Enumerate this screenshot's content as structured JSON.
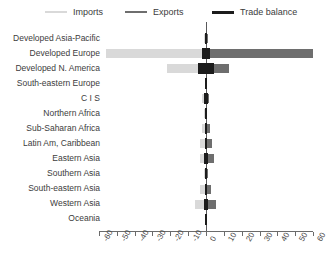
{
  "chart_data": {
    "type": "bar",
    "orientation": "horizontal",
    "title": "",
    "subtitle": "",
    "xlabel": "",
    "ylabel": "",
    "xlim": [
      -60,
      60
    ],
    "xticks": [
      -60,
      -50,
      -40,
      -30,
      -20,
      -10,
      0,
      10,
      20,
      30,
      40,
      50,
      60
    ],
    "xtick_labels": [
      "-60",
      "-50",
      "-40",
      "-30",
      "-20",
      "-10",
      "0",
      "10",
      "20",
      "30",
      "40",
      "50",
      "60"
    ],
    "grid": false,
    "legend_position": "top",
    "zero_line": 0,
    "categories": [
      "Developed Asia-Pacific",
      "Developed Europe",
      "Developed N. America",
      "South-eastern Europe",
      "C I S",
      "Northern Africa",
      "Sub-Saharan Africa",
      "Latin Am, Caribbean",
      "Eastern Asia",
      "Southern Asia",
      "South-eastern Asia",
      "Western Asia",
      "Oceania"
    ],
    "series": [
      {
        "name": "Imports",
        "color": "#d9d9d9",
        "values": [
          -1.2,
          -56.0,
          -22.0,
          -0.4,
          -2.0,
          -1.0,
          -2.2,
          -3.4,
          -3.6,
          -1.4,
          -3.2,
          -6.0,
          -0.2
        ]
      },
      {
        "name": "Exports",
        "color": "#6e6e6e",
        "values": [
          1.2,
          60.0,
          13.0,
          0.4,
          1.6,
          0.8,
          2.0,
          3.2,
          4.6,
          1.4,
          2.6,
          5.4,
          0.2
        ]
      },
      {
        "name": "Trade balance",
        "color": "#1c1c1c",
        "values": [
          1.2,
          4.0,
          9.0,
          0.4,
          2.2,
          1.0,
          1.2,
          1.6,
          2.6,
          1.6,
          1.4,
          2.4,
          0.2
        ]
      }
    ]
  },
  "legend": {
    "items": [
      {
        "label": "Imports",
        "color": "#d9d9d9",
        "thickness": 2
      },
      {
        "label": "Exports",
        "color": "#6e6e6e",
        "thickness": 2
      },
      {
        "label": "Trade balance",
        "color": "#1c1c1c",
        "thickness": 3
      }
    ]
  },
  "axis": {
    "tick_labels": [
      "-60",
      "-50",
      "-40",
      "-30",
      "-20",
      "-10",
      "0",
      "10",
      "20",
      "30",
      "40",
      "50",
      "60"
    ]
  }
}
